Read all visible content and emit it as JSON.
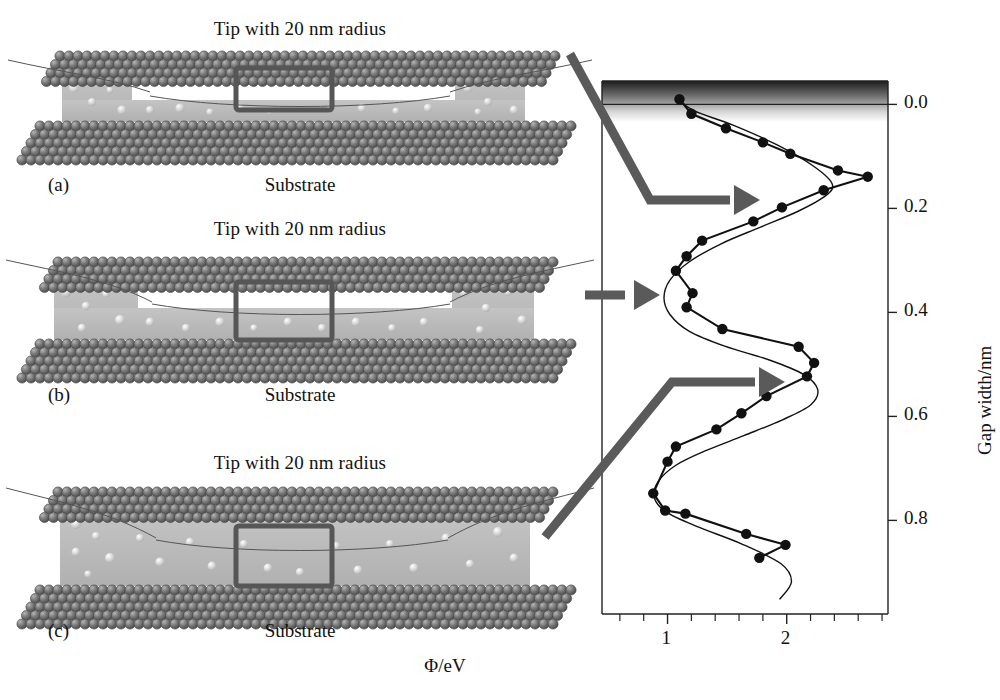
{
  "figure": {
    "panels": [
      {
        "letter": "(a)",
        "title": "Tip with 20 nm radius",
        "substrate": "Substrate",
        "film_thickness_label": "thin"
      },
      {
        "letter": "(b)",
        "title": "Tip with 20 nm radius",
        "substrate": "Substrate",
        "film_thickness_label": "medium"
      },
      {
        "letter": "(c)",
        "title": "Tip with 20 nm radius",
        "substrate": "Substrate",
        "film_thickness_label": "thick"
      }
    ],
    "colors": {
      "sphere_dark": "#6f6f6f",
      "sphere_dark_edge": "#4a4a4a",
      "film_gray": "#b9b9b9",
      "highlight_box": "#565656",
      "arrow": "#5a5a5a",
      "axis": "#222222",
      "curve": "#111111"
    },
    "annotation_arrows": [
      {
        "name": "arrow-from-panel-a",
        "target_gap_width": 0.155
      },
      {
        "name": "arrow-from-panel-b",
        "target_gap_width": 0.345
      },
      {
        "name": "arrow-from-panel-c",
        "target_gap_width": 0.535
      }
    ]
  },
  "chart_data": {
    "type": "scatter",
    "title": "",
    "xlabel": "Φ/eV",
    "ylabel": "Gap width/nm",
    "xlim": [
      0.45,
      2.85
    ],
    "ylim": [
      -0.045,
      0.98
    ],
    "y_inverted": true,
    "grid": false,
    "legend": null,
    "xticks_major": [
      1,
      2
    ],
    "xtick_labels": [
      "1",
      "2"
    ],
    "xticks_minor": [
      0.6,
      0.8,
      1.2,
      1.4,
      1.6,
      1.8,
      2.2,
      2.4,
      2.6,
      2.8
    ],
    "yticks": [
      0.0,
      0.2,
      0.4,
      0.6,
      0.8
    ],
    "ytick_labels": [
      "0.0",
      "0.2",
      "0.4",
      "0.6",
      "0.8"
    ],
    "series": [
      {
        "name": "measured-data",
        "style": "markers-with-line",
        "marker": "filled-circle",
        "x": [
          1.1,
          1.2,
          1.49,
          1.8,
          2.03,
          2.43,
          2.68,
          2.31,
          1.96,
          1.72,
          1.29,
          1.16,
          1.07,
          1.21,
          1.16,
          1.46,
          2.1,
          2.23,
          2.17,
          1.83,
          1.62,
          1.41,
          1.07,
          1.0,
          0.88,
          0.98,
          1.15,
          1.66,
          1.99,
          1.77
        ],
        "y": [
          -0.01,
          0.018,
          0.046,
          0.073,
          0.095,
          0.127,
          0.139,
          0.165,
          0.198,
          0.225,
          0.262,
          0.292,
          0.32,
          0.363,
          0.39,
          0.432,
          0.466,
          0.497,
          0.523,
          0.561,
          0.594,
          0.625,
          0.658,
          0.687,
          0.748,
          0.781,
          0.787,
          0.826,
          0.847,
          0.872
        ]
      },
      {
        "name": "fit-curve",
        "style": "smooth-line",
        "marker": "none",
        "x": [
          1.08,
          1.22,
          1.55,
          1.92,
          2.22,
          2.38,
          2.33,
          2.1,
          1.78,
          1.45,
          1.18,
          1.02,
          0.97,
          1.02,
          1.18,
          1.48,
          1.86,
          2.14,
          2.26,
          2.2,
          1.96,
          1.64,
          1.32,
          1.07,
          0.92,
          0.89,
          0.99,
          1.25,
          1.62,
          1.95,
          2.04,
          1.94
        ],
        "y": [
          -0.012,
          0.012,
          0.04,
          0.078,
          0.118,
          0.152,
          0.175,
          0.205,
          0.236,
          0.268,
          0.303,
          0.338,
          0.372,
          0.404,
          0.436,
          0.465,
          0.492,
          0.519,
          0.548,
          0.578,
          0.607,
          0.637,
          0.666,
          0.694,
          0.726,
          0.757,
          0.784,
          0.812,
          0.845,
          0.883,
          0.918,
          0.952
        ]
      }
    ],
    "surface_band": {
      "label": "substrate-surface-gradient",
      "from_y": -0.045,
      "to_y": 0.0
    }
  }
}
